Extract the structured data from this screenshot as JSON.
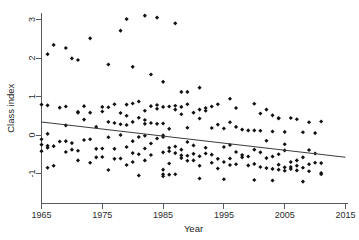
{
  "chart_data": {
    "type": "scatter",
    "title": "",
    "xlabel": "Year",
    "ylabel": "Class index",
    "xlim": [
      1964.0,
      2016.0
    ],
    "ylim": [
      -1.35,
      3.25
    ],
    "xticks": [
      1965,
      1975,
      1985,
      1995,
      2005,
      2015
    ],
    "xtick_labels": [
      "1965",
      "1975",
      "1985",
      "1995",
      "2005",
      "2015"
    ],
    "yticks": [
      -1,
      0,
      1,
      2,
      3
    ],
    "ytick_labels": [
      "-1",
      "0",
      "1",
      "2",
      "3"
    ],
    "grid": false,
    "legend": false,
    "marker": "filled-diamond",
    "marker_color": "#111111",
    "axis_color": "#555b5e",
    "trend_line": {
      "name": "linear fit",
      "color": "#3a3f42",
      "x": [
        1965,
        2015
      ],
      "y": [
        0.34,
        -0.58
      ]
    },
    "series": [
      {
        "name": "Class index by year",
        "points": [
          [
            1965,
            0.79
          ],
          [
            1965,
            -0.11
          ],
          [
            1965,
            -0.25
          ],
          [
            1965,
            -0.42
          ],
          [
            1966,
            2.1
          ],
          [
            1966,
            0.77
          ],
          [
            1966,
            0.03
          ],
          [
            1966,
            -0.28
          ],
          [
            1966,
            -0.33
          ],
          [
            1966,
            -0.85
          ],
          [
            1967,
            2.34
          ],
          [
            1967,
            -0.29
          ],
          [
            1967,
            -0.8
          ],
          [
            1968,
            0.71
          ],
          [
            1968,
            -0.17
          ],
          [
            1969,
            2.26
          ],
          [
            1969,
            0.74
          ],
          [
            1969,
            0.25
          ],
          [
            1969,
            -0.16
          ],
          [
            1969,
            -0.44
          ],
          [
            1970,
            1.99
          ],
          [
            1970,
            -0.21
          ],
          [
            1970,
            -0.38
          ],
          [
            1971,
            1.95
          ],
          [
            1971,
            0.58
          ],
          [
            1971,
            0.6
          ],
          [
            1971,
            -0.41
          ],
          [
            1971,
            -0.66
          ],
          [
            1972,
            0.75
          ],
          [
            1972,
            0.4
          ],
          [
            1972,
            -0.13
          ],
          [
            1973,
            2.51
          ],
          [
            1973,
            0.58
          ],
          [
            1973,
            -0.11
          ],
          [
            1973,
            -0.72
          ],
          [
            1974,
            0.21
          ],
          [
            1974,
            -0.36
          ],
          [
            1974,
            -0.58
          ],
          [
            1975,
            0.73
          ],
          [
            1975,
            0.61
          ],
          [
            1975,
            -0.35
          ],
          [
            1975,
            -0.57
          ],
          [
            1976,
            1.83
          ],
          [
            1976,
            0.72
          ],
          [
            1976,
            0.34
          ],
          [
            1976,
            -0.06
          ],
          [
            1976,
            -0.91
          ],
          [
            1977,
            0.8
          ],
          [
            1977,
            0.31
          ],
          [
            1977,
            -0.36
          ],
          [
            1977,
            -0.62
          ],
          [
            1978,
            2.71
          ],
          [
            1978,
            0.57
          ],
          [
            1978,
            0.28
          ],
          [
            1978,
            0.0
          ],
          [
            1978,
            -0.61
          ],
          [
            1979,
            3.01
          ],
          [
            1979,
            0.79
          ],
          [
            1979,
            0.5
          ],
          [
            1979,
            0.26
          ],
          [
            1979,
            -0.31
          ],
          [
            1979,
            -0.78
          ],
          [
            1980,
            1.77
          ],
          [
            1980,
            0.82
          ],
          [
            1980,
            0.34
          ],
          [
            1980,
            -0.16
          ],
          [
            1980,
            -0.47
          ],
          [
            1980,
            -0.7
          ],
          [
            1981,
            0.87
          ],
          [
            1981,
            0.45
          ],
          [
            1981,
            -0.05
          ],
          [
            1981,
            -0.5
          ],
          [
            1981,
            -1.05
          ],
          [
            1982,
            3.1
          ],
          [
            1982,
            0.63
          ],
          [
            1982,
            0.39
          ],
          [
            1982,
            0.29
          ],
          [
            1982,
            -0.02
          ],
          [
            1982,
            -0.35
          ],
          [
            1982,
            -0.66
          ],
          [
            1983,
            1.57
          ],
          [
            1983,
            0.75
          ],
          [
            1983,
            0.31
          ],
          [
            1983,
            -0.22
          ],
          [
            1983,
            -0.52
          ],
          [
            1984,
            3.05
          ],
          [
            1984,
            0.78
          ],
          [
            1984,
            0.68
          ],
          [
            1984,
            0.29
          ],
          [
            1984,
            -0.09
          ],
          [
            1985,
            1.38
          ],
          [
            1985,
            0.73
          ],
          [
            1985,
            0.3
          ],
          [
            1985,
            -0.01
          ],
          [
            1985,
            -0.05
          ],
          [
            1985,
            -0.45
          ],
          [
            1985,
            -0.9
          ],
          [
            1985,
            -1.02
          ],
          [
            1985,
            -1.07
          ],
          [
            1986,
            0.74
          ],
          [
            1986,
            0.16
          ],
          [
            1986,
            -0.33
          ],
          [
            1986,
            -0.42
          ],
          [
            1986,
            -0.74
          ],
          [
            1986,
            -1.03
          ],
          [
            1987,
            2.9
          ],
          [
            1987,
            0.76
          ],
          [
            1987,
            0.66
          ],
          [
            1987,
            -0.3
          ],
          [
            1987,
            -0.47
          ],
          [
            1987,
            -1.02
          ],
          [
            1988,
            1.12
          ],
          [
            1988,
            0.73
          ],
          [
            1988,
            0.54
          ],
          [
            1988,
            -0.38
          ],
          [
            1988,
            -0.53
          ],
          [
            1988,
            -0.6
          ],
          [
            1989,
            1.12
          ],
          [
            1989,
            0.8
          ],
          [
            1989,
            0.19
          ],
          [
            1989,
            -0.18
          ],
          [
            1989,
            -0.54
          ],
          [
            1989,
            -0.67
          ],
          [
            1990,
            0.58
          ],
          [
            1990,
            -0.27
          ],
          [
            1990,
            -0.49
          ],
          [
            1990,
            -0.66
          ],
          [
            1991,
            1.23
          ],
          [
            1991,
            0.66
          ],
          [
            1991,
            0.43
          ],
          [
            1991,
            -0.55
          ],
          [
            1991,
            -0.8
          ],
          [
            1991,
            -1.13
          ],
          [
            1992,
            0.7
          ],
          [
            1992,
            0.63
          ],
          [
            1992,
            -0.33
          ],
          [
            1992,
            -0.48
          ],
          [
            1993,
            0.74
          ],
          [
            1993,
            0.18
          ],
          [
            1993,
            -0.51
          ],
          [
            1993,
            -0.72
          ],
          [
            1994,
            0.8
          ],
          [
            1994,
            0.27
          ],
          [
            1994,
            -0.62
          ],
          [
            1994,
            -0.87
          ],
          [
            1995,
            0.17
          ],
          [
            1995,
            -0.31
          ],
          [
            1995,
            -0.7
          ],
          [
            1995,
            -1.15
          ],
          [
            1996,
            0.94
          ],
          [
            1996,
            0.33
          ],
          [
            1996,
            -0.26
          ],
          [
            1996,
            -0.61
          ],
          [
            1996,
            -0.78
          ],
          [
            1997,
            0.7
          ],
          [
            1997,
            0.21
          ],
          [
            1997,
            -0.44
          ],
          [
            1997,
            -0.76
          ],
          [
            1998,
            0.14
          ],
          [
            1998,
            -0.52
          ],
          [
            1998,
            -0.58
          ],
          [
            1999,
            0.12
          ],
          [
            1999,
            -0.56
          ],
          [
            1999,
            -0.79
          ],
          [
            2000,
            0.81
          ],
          [
            2000,
            0.12
          ],
          [
            2000,
            -0.38
          ],
          [
            2000,
            -0.75
          ],
          [
            2000,
            -1.17
          ],
          [
            2001,
            0.56
          ],
          [
            2001,
            0.11
          ],
          [
            2001,
            -0.45
          ],
          [
            2001,
            -0.83
          ],
          [
            2002,
            0.66
          ],
          [
            2002,
            -0.15
          ],
          [
            2002,
            -0.6
          ],
          [
            2002,
            -0.86
          ],
          [
            2003,
            0.51
          ],
          [
            2003,
            0.09
          ],
          [
            2003,
            -0.56
          ],
          [
            2003,
            -0.88
          ],
          [
            2003,
            -1.18
          ],
          [
            2004,
            0.44
          ],
          [
            2004,
            0.43
          ],
          [
            2004,
            -0.5
          ],
          [
            2004,
            -0.77
          ],
          [
            2004,
            -0.9
          ],
          [
            2005,
            0.08
          ],
          [
            2005,
            -0.24
          ],
          [
            2005,
            -0.4
          ],
          [
            2005,
            -0.84
          ],
          [
            2005,
            -0.93
          ],
          [
            2006,
            0.44
          ],
          [
            2006,
            -0.7
          ],
          [
            2006,
            -0.83
          ],
          [
            2006,
            -0.88
          ],
          [
            2007,
            0.41
          ],
          [
            2007,
            -0.66
          ],
          [
            2007,
            -0.8
          ],
          [
            2007,
            -0.92
          ],
          [
            2008,
            0.07
          ],
          [
            2008,
            -0.58
          ],
          [
            2008,
            -0.85
          ],
          [
            2008,
            -1.21
          ],
          [
            2009,
            0.33
          ],
          [
            2009,
            -0.39
          ],
          [
            2009,
            -0.76
          ],
          [
            2009,
            -0.94
          ],
          [
            2010,
            0.05
          ],
          [
            2010,
            -0.48
          ],
          [
            2010,
            -0.72
          ],
          [
            2011,
            0.35
          ],
          [
            2011,
            -0.73
          ],
          [
            2011,
            -0.99
          ],
          [
            2011,
            -1.02
          ]
        ]
      }
    ]
  },
  "axes": {
    "x_axis_name": "year-axis",
    "y_axis_name": "class-index-axis"
  }
}
